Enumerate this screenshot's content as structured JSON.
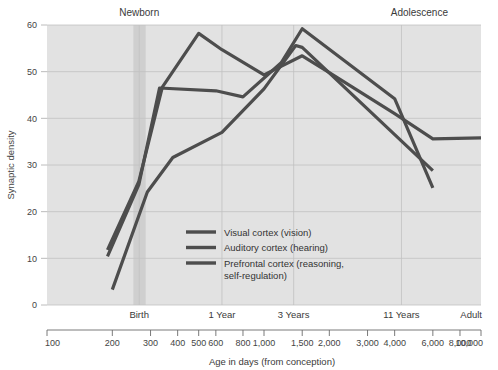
{
  "chart_data": {
    "type": "line",
    "title": "",
    "xlabel": "Age in days (from conception)",
    "ylabel": "Synaptic density",
    "xscale": "log",
    "xlim": [
      100,
      10000
    ],
    "ylim": [
      0,
      60
    ],
    "grid": true,
    "legend_position": "inside-bottom-center",
    "y_ticks": [
      0,
      10,
      20,
      30,
      40,
      50,
      60
    ],
    "x_ticks": [
      100,
      200,
      300,
      400,
      500,
      600,
      800,
      1000,
      1500,
      2000,
      3000,
      4000,
      6000,
      8000,
      10000
    ],
    "x_tick_labels": [
      "100",
      "200",
      "300",
      "400",
      "500",
      "600",
      "800",
      "1,000",
      "1,500",
      "2,000",
      "3,000",
      "4,000",
      "6,000",
      "8,000",
      "10,000"
    ],
    "stage_markers": [
      {
        "label": "Birth",
        "x": 266
      },
      {
        "label": "1 Year",
        "x": 640
      },
      {
        "label": "3 Years",
        "x": 1370
      },
      {
        "label": "11 Years",
        "x": 4300
      },
      {
        "label": "Adult",
        "x": 10000
      }
    ],
    "top_annotations": [
      {
        "label": "Newborn",
        "x": 266
      },
      {
        "label": "Adolescence",
        "x": 5200
      }
    ],
    "highlight_band": {
      "label": "Newborn",
      "x_start": 250,
      "x_end": 285
    },
    "series": [
      {
        "name": "Visual cortex (vision)",
        "color": "#4d4d4d",
        "points": [
          {
            "x": 190,
            "y": 11.8
          },
          {
            "x": 265,
            "y": 26.5
          },
          {
            "x": 340,
            "y": 46.7
          },
          {
            "x": 500,
            "y": 58.2
          },
          {
            "x": 640,
            "y": 54.7
          },
          {
            "x": 1000,
            "y": 49.3
          },
          {
            "x": 1500,
            "y": 53.4
          },
          {
            "x": 2000,
            "y": 49.8
          },
          {
            "x": 4000,
            "y": 41.0
          },
          {
            "x": 6000,
            "y": 35.6
          },
          {
            "x": 10000,
            "y": 35.8
          }
        ]
      },
      {
        "name": "Auditory cortex (hearing)",
        "color": "#4d4d4d",
        "points": [
          {
            "x": 190,
            "y": 10.4
          },
          {
            "x": 265,
            "y": 25.8
          },
          {
            "x": 330,
            "y": 46.5
          },
          {
            "x": 600,
            "y": 45.9
          },
          {
            "x": 800,
            "y": 44.6
          },
          {
            "x": 1200,
            "y": 51.9
          },
          {
            "x": 1500,
            "y": 59.2
          },
          {
            "x": 4000,
            "y": 44.2
          },
          {
            "x": 6000,
            "y": 25.1
          }
        ]
      },
      {
        "name": "Prefrontal cortex (reasoning, self-regulation)",
        "color": "#4d4d4d",
        "points": [
          {
            "x": 200,
            "y": 3.3
          },
          {
            "x": 290,
            "y": 24.2
          },
          {
            "x": 380,
            "y": 31.6
          },
          {
            "x": 640,
            "y": 37.0
          },
          {
            "x": 1000,
            "y": 46.3
          },
          {
            "x": 1400,
            "y": 55.6
          },
          {
            "x": 1500,
            "y": 55.2
          },
          {
            "x": 6000,
            "y": 28.8
          }
        ]
      }
    ]
  },
  "legend": {
    "items": [
      {
        "label": "Visual cortex (vision)",
        "color": "#4d4d4d"
      },
      {
        "label": "Auditory cortex (hearing)",
        "color": "#4d4d4d"
      },
      {
        "label": "Prefrontal cortex (reasoning,",
        "label2": "self-regulation)",
        "color": "#4d4d4d"
      }
    ]
  },
  "colors": {
    "plot_background": "#e2e2e2",
    "band": "#cfcfcf",
    "grid": "#c2c2c2",
    "line": "#4d4d4d",
    "text": "#3c3c3c",
    "page_background": "#ffffff"
  }
}
